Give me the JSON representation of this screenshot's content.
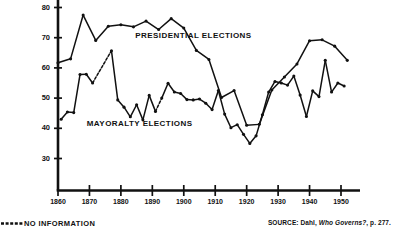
{
  "legend": {
    "no_information_label": "NO INFORMATION",
    "dash_swatch": "dashed-line-swatch"
  },
  "source": {
    "prefix": "SOURCE: Dahl,",
    "title": "Who Governs?",
    "suffix": ", p. 277."
  },
  "colors": {
    "ink": "#111111",
    "background": "#ffffff"
  },
  "chart_data": {
    "type": "line",
    "title": "",
    "xlabel": "",
    "ylabel": "",
    "xlim": [
      1858,
      1955
    ],
    "ylim": [
      25,
      82
    ],
    "xticks": [
      1860,
      1870,
      1880,
      1890,
      1900,
      1910,
      1920,
      1930,
      1940,
      1950
    ],
    "xticklabels": [
      "1860",
      "1870",
      "1880",
      "1890",
      "1900",
      "1910",
      "1920",
      "1930",
      "1940",
      "1950"
    ],
    "yticks": [
      30,
      40,
      50,
      60,
      70,
      80
    ],
    "yticklabels": [
      "30",
      "40",
      "50",
      "60",
      "70",
      "80"
    ],
    "grid": false,
    "legend_position": "inline-annotations",
    "annotations": [
      {
        "name": "presidential-elections-label",
        "text": "PRESIDENTIAL ELECTIONS",
        "x": 1903,
        "y": 70.5
      },
      {
        "name": "mayoralty-elections-label",
        "text": "MAYORALTY ELECTIONS",
        "x": 1886,
        "y": 41.5
      }
    ],
    "series": [
      {
        "name": "PRESIDENTIAL ELECTIONS",
        "marker": "filled-circle",
        "linestyle": "solid",
        "x": [
          1860,
          1864,
          1868,
          1872,
          1876,
          1880,
          1884,
          1888,
          1892,
          1896,
          1900,
          1904,
          1908,
          1912,
          1916,
          1920,
          1924,
          1928,
          1932,
          1936,
          1940,
          1944,
          1948,
          1952
        ],
        "y": [
          61.7,
          63.0,
          77.5,
          69.1,
          73.8,
          74.3,
          73.6,
          75.5,
          72.7,
          76.3,
          73.2,
          65.8,
          62.8,
          50.2,
          52.5,
          41.0,
          41.3,
          52.7,
          57.0,
          61.3,
          69.0,
          69.3,
          67.2,
          62.5
        ]
      },
      {
        "name": "MAYORALTY ELECTIONS",
        "marker": "filled-circle",
        "linestyle": "solid-with-dashed-gaps",
        "dashed_segments": [
          [
            1871,
            1877
          ],
          [
            1891,
            1893
          ]
        ],
        "x": [
          1861,
          1863,
          1865,
          1867,
          1869,
          1871,
          1877,
          1879,
          1881,
          1883,
          1885,
          1887,
          1889,
          1891,
          1893,
          1895,
          1897,
          1899,
          1901,
          1903,
          1905,
          1907,
          1909,
          1911,
          1913,
          1915,
          1917,
          1919,
          1921,
          1923,
          1925,
          1927,
          1929,
          1931,
          1933,
          1935,
          1937,
          1939,
          1941,
          1943,
          1945,
          1947,
          1949,
          1951
        ],
        "y": [
          43.0,
          45.4,
          45.2,
          57.8,
          57.9,
          55.0,
          65.7,
          49.4,
          47.0,
          43.8,
          47.8,
          42.8,
          50.9,
          45.6,
          50.0,
          54.9,
          52.0,
          51.5,
          49.5,
          49.4,
          49.7,
          48.3,
          46.2,
          52.5,
          44.7,
          40.2,
          41.2,
          38.0,
          35.0,
          37.5,
          44.5,
          52.0,
          55.5,
          55.0,
          54.3,
          57.3,
          51.0,
          43.9,
          52.4,
          50.5,
          62.5,
          52.0,
          55.0,
          54.0
        ]
      }
    ]
  }
}
